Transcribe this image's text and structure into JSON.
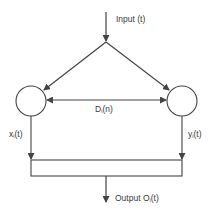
{
  "diagram": {
    "title": "",
    "colors": {
      "stroke": "#444444",
      "text": "#3a3a3a",
      "background": "#ffffff"
    },
    "nodes": [
      {
        "id": "left-node",
        "shape": "circle",
        "label": ""
      },
      {
        "id": "right-node",
        "shape": "circle",
        "label": ""
      },
      {
        "id": "combiner",
        "shape": "rectangle",
        "label": ""
      }
    ],
    "labels": {
      "input": {
        "prefix": "Input (t)"
      },
      "link": {
        "base": "D",
        "sub": "i",
        "suffix": "(n)"
      },
      "left_out": {
        "base": "x",
        "sub": "i",
        "suffix": "(t)"
      },
      "right_out": {
        "base": "y",
        "sub": "i",
        "suffix": "(t)"
      },
      "output": {
        "prefix": "Output O",
        "sub": "i",
        "suffix": "(t)"
      }
    },
    "edges": [
      {
        "from": "Input (t)",
        "to": "split-point",
        "type": "arrow"
      },
      {
        "from": "split-point",
        "to": "left-node",
        "type": "arrow"
      },
      {
        "from": "split-point",
        "to": "right-node",
        "type": "arrow"
      },
      {
        "from": "left-node",
        "to": "right-node",
        "type": "double-arrow",
        "label": "Di(n)"
      },
      {
        "from": "left-node",
        "to": "combiner",
        "type": "arrow",
        "label": "xi(t)"
      },
      {
        "from": "right-node",
        "to": "combiner",
        "type": "arrow",
        "label": "yi(t)"
      },
      {
        "from": "combiner",
        "to": "Output Oi(t)",
        "type": "arrow"
      }
    ]
  }
}
